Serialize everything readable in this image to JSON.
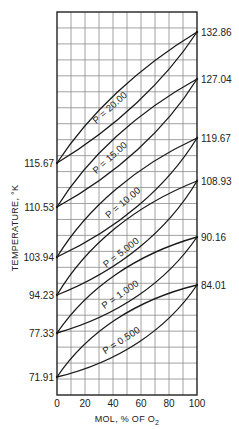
{
  "chart_data": {
    "type": "line",
    "title": "",
    "xlabel": "MOL, % OF O2",
    "xlabel_main": "MOL, % OF O",
    "xlabel_subscript": "2",
    "ylabel": "TEMPERATURE, °K",
    "xlim": [
      0,
      100
    ],
    "x_ticks": [
      "0",
      "20",
      "40",
      "60",
      "80",
      "100"
    ],
    "x_tick_values": [
      0,
      20,
      40,
      60,
      80,
      100
    ],
    "grid": true,
    "grid_columns": 10,
    "grid_rows": 24,
    "left_axis_labels": [
      "115.67",
      "110.53",
      "103.94",
      "94.23",
      "77.33",
      "71.91"
    ],
    "right_axis_labels": [
      "132.86",
      "127.04",
      "119.67",
      "108.93",
      "90.16",
      "84.01"
    ],
    "series": [
      {
        "name": "P = 20.00",
        "pressure": 20.0,
        "t_at_0": 115.67,
        "t_at_100": 132.86,
        "left_y": 163,
        "right_y": 32,
        "upper_bulge": 14,
        "lower_bulge": 14
      },
      {
        "name": "P = 15.00",
        "pressure": 15.0,
        "t_at_0": 110.53,
        "t_at_100": 127.04,
        "left_y": 207,
        "right_y": 79,
        "upper_bulge": 16,
        "lower_bulge": 16
      },
      {
        "name": "P = 10.00",
        "pressure": 10.0,
        "t_at_0": 103.94,
        "t_at_100": 119.67,
        "left_y": 257,
        "right_y": 138,
        "upper_bulge": 18,
        "lower_bulge": 18
      },
      {
        "name": "P = 5.000",
        "pressure": 5.0,
        "t_at_0": 94.23,
        "t_at_100": 108.93,
        "left_y": 295,
        "right_y": 181,
        "upper_bulge": 20,
        "lower_bulge": 20
      },
      {
        "name": "P = 1.000",
        "pressure": 1.0,
        "t_at_0": 77.33,
        "t_at_100": 90.16,
        "left_y": 333,
        "right_y": 237,
        "upper_bulge": 20,
        "lower_bulge": 20
      },
      {
        "name": "P = 0.500",
        "pressure": 0.5,
        "t_at_0": 71.91,
        "t_at_100": 84.01,
        "left_y": 377,
        "right_y": 285,
        "upper_bulge": 21,
        "lower_bulge": 21
      }
    ],
    "curve_labels": [
      {
        "text": "P = 20.00",
        "x": 112,
        "y": 110,
        "angle": -42
      },
      {
        "text": "P = 15.00",
        "x": 112,
        "y": 160,
        "angle": -42
      },
      {
        "text": "P = 10.00",
        "x": 125,
        "y": 205,
        "angle": -40
      },
      {
        "text": "P = 5.000",
        "x": 123,
        "y": 255,
        "angle": -38
      },
      {
        "text": "P = 1.000",
        "x": 122,
        "y": 297,
        "angle": -35
      },
      {
        "text": "P = 0.500",
        "x": 123,
        "y": 343,
        "angle": -33
      }
    ]
  },
  "plot_box": {
    "x0": 57,
    "y0": 12,
    "x1": 197,
    "y1": 395
  }
}
